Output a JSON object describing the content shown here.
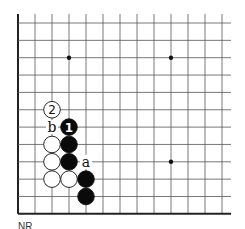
{
  "diagram": {
    "type": "go-board-fragment",
    "corner": "bottom-left",
    "grid": {
      "columns": 13,
      "rows": 12,
      "origin_x": 18,
      "origin_y": 23,
      "spacing_x": 17,
      "spacing_y": 17.35,
      "right_extent_x": 231,
      "top_extent_y": 14,
      "line_color": "#555555",
      "edge_color": "#222222"
    },
    "star_points": [
      {
        "col": 3,
        "row": 2
      },
      {
        "col": 9,
        "row": 2
      },
      {
        "col": 9,
        "row": 8
      }
    ],
    "stones": [
      {
        "color": "white",
        "col": 2,
        "row": 5,
        "label": "2",
        "circled": true
      },
      {
        "color": "black",
        "col": 3,
        "row": 6,
        "label": "1"
      },
      {
        "color": "white",
        "col": 2,
        "row": 7,
        "label": ""
      },
      {
        "color": "black",
        "col": 3,
        "row": 7,
        "label": ""
      },
      {
        "color": "white",
        "col": 2,
        "row": 8,
        "label": ""
      },
      {
        "color": "black",
        "col": 3,
        "row": 8,
        "label": ""
      },
      {
        "color": "white",
        "col": 2,
        "row": 9,
        "label": ""
      },
      {
        "color": "white",
        "col": 3,
        "row": 9,
        "label": ""
      },
      {
        "color": "black",
        "col": 4,
        "row": 9,
        "label": ""
      },
      {
        "color": "black",
        "col": 4,
        "row": 10,
        "label": ""
      }
    ],
    "point_labels": [
      {
        "text": "b",
        "col": 2,
        "row": 6
      },
      {
        "text": "a",
        "col": 4,
        "row": 8
      }
    ]
  },
  "caption": "NR"
}
